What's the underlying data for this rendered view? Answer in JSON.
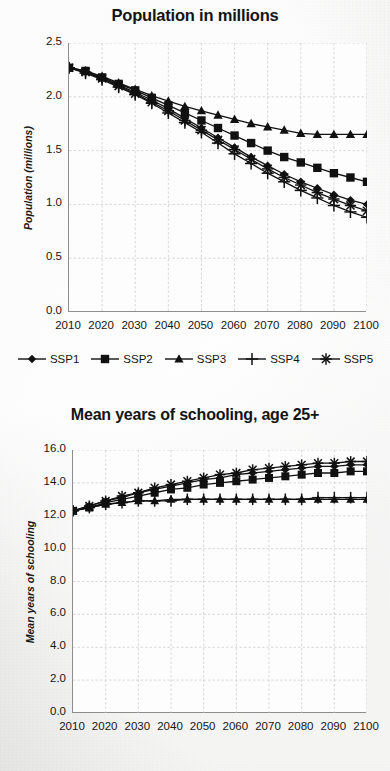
{
  "figure": {
    "background_color": "#ececeb",
    "ink_color": "#111111"
  },
  "series_names": [
    "SSP1",
    "SSP2",
    "SSP3",
    "SSP4",
    "SSP5"
  ],
  "markers": {
    "SSP1": "diamond",
    "SSP2": "square",
    "SSP3": "triangle",
    "SSP4": "plus",
    "SSP5": "asterisk"
  },
  "legend": {
    "position": "below-chart-1",
    "items": [
      {
        "label": "SSP1",
        "marker": "diamond-marker-icon"
      },
      {
        "label": "SSP2",
        "marker": "square-marker-icon"
      },
      {
        "label": "SSP3",
        "marker": "triangle-marker-icon"
      },
      {
        "label": "SSP4",
        "marker": "plus-marker-icon"
      },
      {
        "label": "SSP5",
        "marker": "asterisk-marker-icon"
      }
    ]
  },
  "chart_data": [
    {
      "id": "population",
      "type": "line",
      "title": "Population in millions",
      "xlabel": "",
      "ylabel": "Population (millions)",
      "xlim": [
        2010,
        2100
      ],
      "ylim": [
        0.0,
        2.5
      ],
      "ytick_labels": [
        "2.5",
        "2.0",
        "1.5",
        "1.0",
        "0.5",
        "0.0"
      ],
      "ytick_values": [
        2.5,
        2.0,
        1.5,
        1.0,
        0.5,
        0.0
      ],
      "xtick_labels": [
        "2010",
        "2020",
        "2030",
        "2040",
        "2050",
        "2060",
        "2070",
        "2080",
        "2090",
        "2100"
      ],
      "xtick_values": [
        2010,
        2020,
        2030,
        2040,
        2050,
        2060,
        2070,
        2080,
        2090,
        2100
      ],
      "grid": true,
      "legend": true,
      "x": [
        2010,
        2015,
        2020,
        2025,
        2030,
        2035,
        2040,
        2045,
        2050,
        2055,
        2060,
        2065,
        2070,
        2075,
        2080,
        2085,
        2090,
        2095,
        2100
      ],
      "series": [
        {
          "name": "SSP1",
          "marker": "diamond",
          "values": [
            2.27,
            2.23,
            2.17,
            2.11,
            2.04,
            1.97,
            1.89,
            1.8,
            1.71,
            1.62,
            1.53,
            1.44,
            1.36,
            1.28,
            1.21,
            1.15,
            1.09,
            1.04,
            1.0
          ]
        },
        {
          "name": "SSP2",
          "marker": "square",
          "values": [
            2.27,
            2.24,
            2.18,
            2.12,
            2.06,
            1.99,
            1.92,
            1.85,
            1.78,
            1.71,
            1.64,
            1.57,
            1.5,
            1.44,
            1.39,
            1.34,
            1.29,
            1.25,
            1.21
          ]
        },
        {
          "name": "SSP3",
          "marker": "triangle",
          "values": [
            2.27,
            2.24,
            2.19,
            2.13,
            2.07,
            2.01,
            1.96,
            1.91,
            1.87,
            1.83,
            1.79,
            1.75,
            1.72,
            1.69,
            1.66,
            1.65,
            1.65,
            1.65,
            1.65
          ]
        },
        {
          "name": "SSP4",
          "marker": "plus",
          "values": [
            2.27,
            2.22,
            2.16,
            2.09,
            2.02,
            1.94,
            1.85,
            1.76,
            1.67,
            1.57,
            1.47,
            1.38,
            1.29,
            1.21,
            1.13,
            1.06,
            0.99,
            0.93,
            0.88
          ]
        },
        {
          "name": "SSP5",
          "marker": "asterisk",
          "values": [
            2.27,
            2.23,
            2.17,
            2.1,
            2.03,
            1.95,
            1.87,
            1.78,
            1.69,
            1.6,
            1.51,
            1.42,
            1.33,
            1.25,
            1.18,
            1.11,
            1.05,
            0.99,
            0.94
          ]
        }
      ]
    },
    {
      "id": "schooling",
      "type": "line",
      "title": "Mean years of schooling, age 25+",
      "xlabel": "",
      "ylabel": "Mean years of schooling",
      "xlim": [
        2010,
        2100
      ],
      "ylim": [
        0.0,
        16.0
      ],
      "ytick_labels": [
        "16.0",
        "14.0",
        "12.0",
        "10.0",
        "8.0",
        "6.0",
        "4.0",
        "2.0",
        "0.0"
      ],
      "ytick_values": [
        16.0,
        14.0,
        12.0,
        10.0,
        8.0,
        6.0,
        4.0,
        2.0,
        0.0
      ],
      "xtick_labels": [
        "2010",
        "2020",
        "2030",
        "2040",
        "2050",
        "2060",
        "2070",
        "2080",
        "2090",
        "2100"
      ],
      "xtick_values": [
        2010,
        2020,
        2030,
        2040,
        2050,
        2060,
        2070,
        2080,
        2090,
        2100
      ],
      "grid": true,
      "legend": false,
      "x": [
        2010,
        2015,
        2020,
        2025,
        2030,
        2035,
        2040,
        2045,
        2050,
        2055,
        2060,
        2065,
        2070,
        2075,
        2080,
        2085,
        2090,
        2095,
        2100
      ],
      "series": [
        {
          "name": "SSP1",
          "marker": "diamond",
          "values": [
            12.3,
            12.6,
            12.9,
            13.1,
            13.4,
            13.6,
            13.8,
            14.0,
            14.2,
            14.3,
            14.5,
            14.6,
            14.7,
            14.8,
            14.9,
            15.0,
            15.0,
            15.1,
            15.1
          ]
        },
        {
          "name": "SSP2",
          "marker": "square",
          "values": [
            12.3,
            12.5,
            12.8,
            13.0,
            13.2,
            13.4,
            13.6,
            13.7,
            13.9,
            14.0,
            14.1,
            14.2,
            14.3,
            14.4,
            14.5,
            14.6,
            14.6,
            14.7,
            14.7
          ]
        },
        {
          "name": "SSP3",
          "marker": "triangle",
          "values": [
            12.3,
            12.5,
            12.7,
            12.8,
            12.9,
            12.9,
            13.0,
            13.0,
            13.0,
            13.0,
            13.0,
            13.0,
            13.0,
            13.0,
            13.0,
            13.0,
            13.0,
            13.0,
            13.0
          ]
        },
        {
          "name": "SSP4",
          "marker": "plus",
          "values": [
            12.3,
            12.5,
            12.7,
            12.8,
            12.9,
            12.9,
            12.9,
            13.0,
            13.0,
            13.0,
            13.0,
            13.0,
            13.0,
            13.0,
            13.0,
            13.1,
            13.1,
            13.1,
            13.1
          ]
        },
        {
          "name": "SSP5",
          "marker": "asterisk",
          "values": [
            12.3,
            12.6,
            12.9,
            13.2,
            13.4,
            13.7,
            13.9,
            14.1,
            14.3,
            14.5,
            14.6,
            14.8,
            14.9,
            15.0,
            15.1,
            15.2,
            15.2,
            15.3,
            15.3
          ]
        }
      ]
    }
  ]
}
